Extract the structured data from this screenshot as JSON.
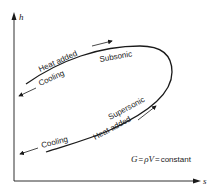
{
  "diagram": {
    "type": "Fanno/Rayleigh-type h-s diagram",
    "axes": {
      "y_label": "h",
      "x_label": "s"
    },
    "branches": {
      "upper": {
        "label": "Subsonic",
        "heat_added_label": "Heat added",
        "cooling_label": "Cooling"
      },
      "lower": {
        "label": "Supersonic",
        "heat_added_label": "Heat added",
        "cooling_label": "Cooling"
      }
    },
    "equation": {
      "lhs": "G",
      "eq1": "=",
      "rho": "ρ",
      "v": "V",
      "eq2": "=",
      "rhs": "constant"
    }
  }
}
